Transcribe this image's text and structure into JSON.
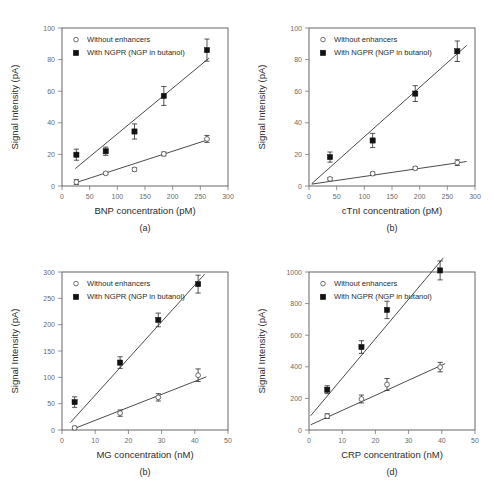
{
  "figure": {
    "legend": {
      "without_label": "Without enhancers",
      "with_label": "With NGPR (NGP in butanol)",
      "without_marker": "open-circle-icon",
      "with_marker": "filled-square-icon"
    },
    "shared_ylabel": "Signal Intensity (pA)"
  },
  "chart_data": [
    {
      "type": "scatter",
      "panel": "a",
      "caption": "(a)",
      "title": "",
      "xlabel": "BNP concentration (pM)",
      "ylabel": "Signal Intensity (pA)",
      "xlim": [
        0,
        300
      ],
      "ylim": [
        0,
        100
      ],
      "xticks": [
        0,
        50,
        100,
        150,
        200,
        250,
        300
      ],
      "yticks": [
        0,
        20,
        40,
        60,
        80,
        100
      ],
      "grid": false,
      "legend_position": "top-left-inside",
      "series": [
        {
          "name": "Without enhancers",
          "marker": "open-circle",
          "x": [
            26,
            79,
            131,
            184,
            262
          ],
          "values": [
            2.5,
            8.0,
            10.5,
            20.3,
            29.8
          ],
          "error": [
            1.5,
            0.8,
            1.0,
            1.2,
            2.2
          ],
          "fit_line": {
            "x": [
              24,
              266
            ],
            "y": [
              2.0,
              29.5
            ]
          }
        },
        {
          "name": "With NGPR (NGP in butanol)",
          "marker": "filled-square",
          "x": [
            26,
            79,
            131,
            184,
            262
          ],
          "values": [
            19.8,
            22.0,
            34.5,
            57.0,
            86.0
          ],
          "error": [
            3.5,
            2.6,
            4.8,
            6.0,
            7.0
          ],
          "fit_line": {
            "x": [
              24,
              266
            ],
            "y": [
              11.0,
              81.0
            ]
          }
        }
      ]
    },
    {
      "type": "scatter",
      "panel": "b",
      "caption": "(b)",
      "title": "",
      "xlabel": "cTnI concentration (pM)",
      "ylabel": "Signal Intensity (pA)",
      "xlim": [
        0,
        300
      ],
      "ylim": [
        0,
        100
      ],
      "xticks": [
        0,
        50,
        100,
        150,
        200,
        250,
        300
      ],
      "yticks": [
        0,
        20,
        40,
        60,
        80,
        100
      ],
      "grid": false,
      "legend_position": "top-left-inside",
      "series": [
        {
          "name": "Without enhancers",
          "marker": "open-circle",
          "x": [
            38,
            115,
            192,
            268
          ],
          "values": [
            4.5,
            7.8,
            11.2,
            14.8
          ],
          "error": [
            0.8,
            1.0,
            0.9,
            1.8
          ],
          "fit_line": {
            "x": [
              5,
              285
            ],
            "y": [
              1.2,
              15.5
            ]
          }
        },
        {
          "name": "With NGPR (NGP in butanol)",
          "marker": "filled-square",
          "x": [
            38,
            115,
            192,
            268
          ],
          "values": [
            18.3,
            28.8,
            58.5,
            85.3
          ],
          "error": [
            3.2,
            4.5,
            5.0,
            6.5
          ],
          "fit_line": {
            "x": [
              5,
              285
            ],
            "y": [
              1.5,
              89.0
            ]
          }
        }
      ]
    },
    {
      "type": "scatter",
      "panel": "c",
      "caption": "(b)",
      "title": "",
      "xlabel": "MG concentration (nM)",
      "ylabel": "Signal Intensity (pA)",
      "xlim": [
        0,
        50
      ],
      "ylim": [
        0,
        300
      ],
      "xticks": [
        0,
        10,
        20,
        30,
        40,
        50
      ],
      "yticks": [
        0,
        50,
        100,
        150,
        200,
        250,
        300
      ],
      "grid": false,
      "legend_position": "top-left-inside",
      "series": [
        {
          "name": "Without enhancers",
          "marker": "open-circle",
          "x": [
            3.8,
            17.5,
            29.0,
            41.0
          ],
          "values": [
            4.0,
            32.0,
            62.0,
            104.0
          ],
          "error": [
            3.0,
            6.0,
            7.0,
            12.0
          ],
          "fit_line": {
            "x": [
              3.0,
              43.5
            ],
            "y": [
              1.0,
              101.0
            ]
          }
        },
        {
          "name": "With NGPR (NGP in butanol)",
          "marker": "filled-square",
          "x": [
            3.8,
            17.5,
            29.0,
            41.0
          ],
          "values": [
            53.0,
            128.0,
            209.0,
            277.0
          ],
          "error": [
            10.0,
            11.0,
            13.0,
            17.0
          ],
          "fit_line": {
            "x": [
              2.5,
              43.0
            ],
            "y": [
              14.0,
              296.0
            ]
          }
        }
      ]
    },
    {
      "type": "scatter",
      "panel": "d",
      "caption": "(d)",
      "title": "",
      "xlabel": "CRP concentration (nM)",
      "ylabel": "Signal Intensity (pA)",
      "xlim": [
        0,
        50
      ],
      "ylim": [
        0,
        1000
      ],
      "xticks": [
        0,
        10,
        20,
        30,
        40,
        50
      ],
      "yticks": [
        0,
        200,
        400,
        600,
        800,
        1000
      ],
      "grid": false,
      "legend_position": "top-left-inside",
      "series": [
        {
          "name": "Without enhancers",
          "marker": "open-circle",
          "x": [
            5.5,
            15.8,
            23.5,
            39.5
          ],
          "values": [
            88,
            196,
            288,
            398
          ],
          "error": [
            15,
            25,
            38,
            30
          ],
          "fit_line": {
            "x": [
              0.5,
              41.0
            ],
            "y": [
              33,
              420
            ]
          }
        },
        {
          "name": "With NGPR (NGP in butanol)",
          "marker": "filled-square",
          "x": [
            5.5,
            15.8,
            23.5,
            39.5
          ],
          "values": [
            255,
            525,
            760,
            1010
          ],
          "error": [
            25,
            40,
            55,
            60
          ],
          "fit_line": {
            "x": [
              0.5,
              40.5
            ],
            "y": [
              90,
              1090
            ]
          }
        }
      ]
    }
  ]
}
